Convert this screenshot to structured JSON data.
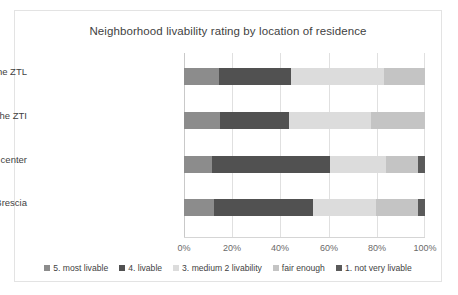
{
  "chart_data": {
    "type": "bar",
    "orientation": "horizontal",
    "stacked": true,
    "normalized_percent": true,
    "title": "Neighborhood livability rating by location of residence",
    "xlabel": "",
    "ylabel": "",
    "xlim": [
      0,
      100
    ],
    "xticks": [
      "0%",
      "20%",
      "40%",
      "60%",
      "80%",
      "100%"
    ],
    "xtick_values": [
      0,
      20,
      40,
      60,
      80,
      100
    ],
    "grid": true,
    "legend_position": "bottom",
    "categories": [
      "in the ZTL",
      "in the center but outside the ZTI",
      "in Brescia but outside the center",
      "outside city of Brescia"
    ],
    "series": [
      {
        "name": "5. most livable",
        "color": "#8c8c8c",
        "values": [
          14.5,
          15.0,
          11.5,
          12.5
        ]
      },
      {
        "name": "4. livable",
        "color": "#515151",
        "values": [
          30.0,
          28.5,
          49.0,
          41.0
        ]
      },
      {
        "name": "3. medium 2 livability",
        "color": "#dcdcdc",
        "values": [
          38.5,
          34.0,
          23.5,
          26.0
        ]
      },
      {
        "name": "fair enough",
        "color": "#c4c4c4",
        "values": [
          17.0,
          22.5,
          13.0,
          17.5
        ]
      },
      {
        "name": "1. not very livable",
        "color": "#5a5a5a",
        "values": [
          0.0,
          0.0,
          3.0,
          3.0
        ]
      }
    ]
  }
}
